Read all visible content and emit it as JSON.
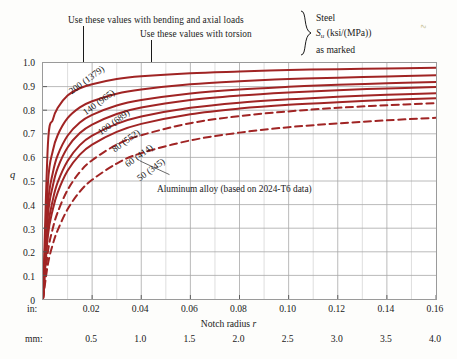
{
  "annotations": {
    "bending": "Use these values with bending and axial loads",
    "torsion": "Use these values with torsion",
    "legend_line1": "Steel",
    "legend_line2_pre": "S",
    "legend_line2_sub": "u",
    "legend_line2_post": " (ksi/(MPa)",
    "legend_line2_post2": ")",
    "legend_line3": "as marked",
    "aluminum": "Aluminum alloy (based on 2024-T6 data)",
    "speck": "∿"
  },
  "axes": {
    "y_label": "q",
    "y_ticks": [
      "1.0",
      "0.9",
      "0.8",
      "0.7",
      "0.6",
      "0.5",
      "0.4",
      "0.3",
      "0.2",
      "0.1",
      "0"
    ],
    "x_title_pre": "Notch radius ",
    "x_title_var": "r",
    "x_unit_in": "in:",
    "x_unit_mm": "mm:",
    "x_ticks_in": [
      "0.02",
      "0.04",
      "0.06",
      "0.08",
      "0.10",
      "0.12",
      "0.14",
      "0.16"
    ],
    "x_ticks_mm": [
      "0.5",
      "1.0",
      "1.5",
      "2.0",
      "2.5",
      "3.0",
      "3.5",
      "4.0"
    ]
  },
  "colors": {
    "curve": "#A02424",
    "grid": "#c9c9c9",
    "grid_major": "#a8a8a8",
    "axis": "#8a8a8a",
    "text": "#1a1a1a"
  },
  "chart_data": {
    "type": "line",
    "xlabel": "Notch radius r",
    "ylabel": "q",
    "xlim": [
      0,
      0.16
    ],
    "ylim": [
      0,
      1.0
    ],
    "x_unit_primary": "in",
    "x_unit_secondary": "mm",
    "grid": true,
    "legend": "inline curve labels",
    "series": [
      {
        "name": "200 (1379)",
        "material": "steel",
        "style": "solid",
        "label_pos": {
          "x": 0.012,
          "y": 0.905,
          "rot": -36
        },
        "points": [
          [
            0,
            0.0
          ],
          [
            0.002,
            0.655
          ],
          [
            0.004,
            0.76
          ],
          [
            0.006,
            0.81
          ],
          [
            0.01,
            0.862
          ],
          [
            0.015,
            0.893
          ],
          [
            0.02,
            0.91
          ],
          [
            0.03,
            0.932
          ],
          [
            0.04,
            0.944
          ],
          [
            0.06,
            0.957
          ],
          [
            0.08,
            0.964
          ],
          [
            0.1,
            0.97
          ],
          [
            0.12,
            0.974
          ],
          [
            0.14,
            0.977
          ],
          [
            0.16,
            0.98
          ]
        ]
      },
      {
        "name": "140 (965)",
        "material": "steel",
        "style": "solid",
        "label_pos": {
          "x": 0.0175,
          "y": 0.818,
          "rot": -36
        },
        "points": [
          [
            0,
            0.0
          ],
          [
            0.002,
            0.49
          ],
          [
            0.004,
            0.628
          ],
          [
            0.006,
            0.695
          ],
          [
            0.01,
            0.766
          ],
          [
            0.015,
            0.812
          ],
          [
            0.02,
            0.838
          ],
          [
            0.03,
            0.87
          ],
          [
            0.04,
            0.888
          ],
          [
            0.06,
            0.91
          ],
          [
            0.08,
            0.923
          ],
          [
            0.1,
            0.932
          ],
          [
            0.12,
            0.938
          ],
          [
            0.14,
            0.943
          ],
          [
            0.16,
            0.948
          ]
        ]
      },
      {
        "name": "100 (689)",
        "material": "steel",
        "style": "solid",
        "label_pos": {
          "x": 0.0235,
          "y": 0.735,
          "rot": -36
        },
        "points": [
          [
            0,
            0.0
          ],
          [
            0.002,
            0.4
          ],
          [
            0.004,
            0.535
          ],
          [
            0.006,
            0.61
          ],
          [
            0.01,
            0.692
          ],
          [
            0.015,
            0.748
          ],
          [
            0.02,
            0.78
          ],
          [
            0.03,
            0.82
          ],
          [
            0.04,
            0.843
          ],
          [
            0.06,
            0.871
          ],
          [
            0.08,
            0.888
          ],
          [
            0.1,
            0.899
          ],
          [
            0.12,
            0.908
          ],
          [
            0.14,
            0.914
          ],
          [
            0.16,
            0.92
          ]
        ]
      },
      {
        "name": "80 (552)",
        "material": "steel",
        "style": "solid",
        "label_pos": {
          "x": 0.0295,
          "y": 0.66,
          "rot": -36
        },
        "points": [
          [
            0,
            0.0
          ],
          [
            0.002,
            0.352
          ],
          [
            0.004,
            0.48
          ],
          [
            0.006,
            0.556
          ],
          [
            0.01,
            0.642
          ],
          [
            0.015,
            0.703
          ],
          [
            0.02,
            0.739
          ],
          [
            0.03,
            0.784
          ],
          [
            0.04,
            0.811
          ],
          [
            0.06,
            0.843
          ],
          [
            0.08,
            0.862
          ],
          [
            0.1,
            0.875
          ],
          [
            0.12,
            0.885
          ],
          [
            0.14,
            0.892
          ],
          [
            0.16,
            0.898
          ]
        ]
      },
      {
        "name": "60 (414)",
        "material": "steel",
        "style": "solid",
        "label_pos": {
          "x": 0.0345,
          "y": 0.598,
          "rot": -36
        },
        "points": [
          [
            0,
            0.0
          ],
          [
            0.002,
            0.3
          ],
          [
            0.004,
            0.42
          ],
          [
            0.006,
            0.495
          ],
          [
            0.01,
            0.585
          ],
          [
            0.015,
            0.652
          ],
          [
            0.02,
            0.692
          ],
          [
            0.03,
            0.742
          ],
          [
            0.04,
            0.773
          ],
          [
            0.06,
            0.81
          ],
          [
            0.08,
            0.832
          ],
          [
            0.1,
            0.846
          ],
          [
            0.12,
            0.857
          ],
          [
            0.14,
            0.865
          ],
          [
            0.16,
            0.872
          ]
        ]
      },
      {
        "name": "50 (345)",
        "material": "steel",
        "style": "solid",
        "label_pos": {
          "x": 0.0395,
          "y": 0.54,
          "rot": -36
        },
        "points": [
          [
            0,
            0.0
          ],
          [
            0.002,
            0.268
          ],
          [
            0.004,
            0.38
          ],
          [
            0.006,
            0.452
          ],
          [
            0.01,
            0.543
          ],
          [
            0.015,
            0.612
          ],
          [
            0.02,
            0.654
          ],
          [
            0.03,
            0.708
          ],
          [
            0.04,
            0.742
          ],
          [
            0.06,
            0.783
          ],
          [
            0.08,
            0.807
          ],
          [
            0.1,
            0.823
          ],
          [
            0.12,
            0.834
          ],
          [
            0.14,
            0.843
          ],
          [
            0.16,
            0.851
          ]
        ]
      },
      {
        "name": "Aluminum alloy (based on 2024-T6 data) upper",
        "material": "aluminum",
        "style": "dashed",
        "points": [
          [
            0,
            0.0
          ],
          [
            0.002,
            0.2
          ],
          [
            0.004,
            0.3
          ],
          [
            0.006,
            0.368
          ],
          [
            0.01,
            0.462
          ],
          [
            0.015,
            0.538
          ],
          [
            0.02,
            0.588
          ],
          [
            0.03,
            0.654
          ],
          [
            0.04,
            0.694
          ],
          [
            0.06,
            0.745
          ],
          [
            0.08,
            0.775
          ],
          [
            0.1,
            0.795
          ],
          [
            0.12,
            0.81
          ],
          [
            0.14,
            0.821
          ],
          [
            0.16,
            0.83
          ]
        ]
      },
      {
        "name": "Aluminum alloy lower",
        "material": "aluminum",
        "style": "dashed",
        "points": [
          [
            0,
            0.0
          ],
          [
            0.002,
            0.148
          ],
          [
            0.004,
            0.232
          ],
          [
            0.006,
            0.292
          ],
          [
            0.01,
            0.38
          ],
          [
            0.015,
            0.455
          ],
          [
            0.02,
            0.505
          ],
          [
            0.03,
            0.574
          ],
          [
            0.04,
            0.618
          ],
          [
            0.06,
            0.672
          ],
          [
            0.08,
            0.705
          ],
          [
            0.1,
            0.728
          ],
          [
            0.12,
            0.744
          ],
          [
            0.14,
            0.757
          ],
          [
            0.16,
            0.768
          ]
        ]
      }
    ],
    "callouts": [
      {
        "text": "Use these values with bending and axial loads",
        "leader_x_in": 0.0165
      },
      {
        "text": "Use these values with torsion",
        "leader_x_in": 0.0445
      }
    ]
  }
}
